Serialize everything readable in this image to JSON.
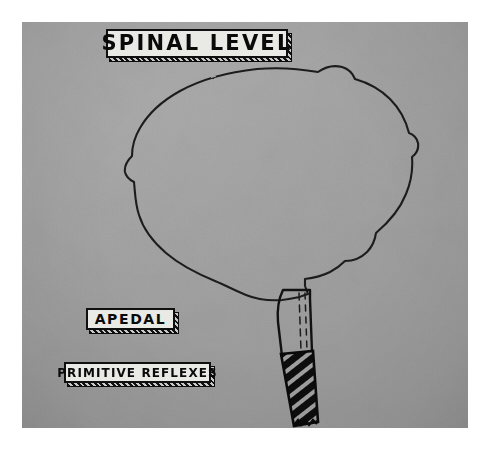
{
  "figure": {
    "kind": "anatomical-diagram",
    "plate_background_color": "#a3a3a3",
    "border_color": "#ffffff",
    "ink_color": "#1a1a1a"
  },
  "labels": {
    "title": {
      "text": "SPINAL LEVEL",
      "face_color": "#e9e9e6",
      "border_color": "#101010"
    },
    "apedal": {
      "text": "APEDAL",
      "face_color": "#e9e9e6",
      "border_color": "#101010"
    },
    "primitive_reflexes": {
      "text": "PRIMITIVE REFLEXES",
      "face_color": "#e9e9e6",
      "border_color": "#101010"
    }
  },
  "anatomy": {
    "cerebrum": {
      "name": "cerebrum-outline",
      "fill": "none",
      "stroke": "#1e1e1e"
    },
    "brainstem_upper": {
      "name": "brainstem-upper-segment",
      "fill": "none",
      "stroke": "#101010",
      "detail": "vertical dashed midline tracts"
    },
    "spinal_cord_lower": {
      "name": "spinal-cord-hatched-segment",
      "fill": "diagonal-hatch",
      "stroke": "#0a0a0a",
      "hatch_angle_deg": 45
    }
  }
}
